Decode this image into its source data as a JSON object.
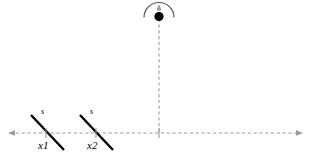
{
  "figure": {
    "title": "",
    "background_color": "#ffffff",
    "stroke_color": "#000000",
    "dashed_color": "#999999",
    "width": 310,
    "height": 158
  },
  "axis": {
    "name": "horizontal-axis",
    "style": "dashed",
    "y": 133,
    "x_start": 8,
    "x_end": 303,
    "arrow_left": true,
    "arrow_right": true
  },
  "vertical_line": {
    "name": "vertical-axis",
    "style": "dashed",
    "x": 159,
    "y_start": 5,
    "y_end": 133,
    "arrow_top": true
  },
  "arc": {
    "name": "semicircle-arc",
    "center_x": 159,
    "center_y": 16,
    "radius": 15,
    "opens": "down"
  },
  "point": {
    "name": "center-point",
    "x": 159,
    "y": 16,
    "radius": 4.5,
    "filled": true
  },
  "segments": [
    {
      "id": "x1",
      "label": "x1",
      "slope_label": "s",
      "x1": 31,
      "y1": 115,
      "x2": 64,
      "y2": 150,
      "label_x": 40,
      "label_y": 139,
      "slope_label_x": 41,
      "slope_label_y": 111,
      "tick_x": 46,
      "tick_y": 133
    },
    {
      "id": "x2",
      "label": "x2",
      "slope_label": "s",
      "x1": 80,
      "y1": 115,
      "x2": 113,
      "y2": 150,
      "label_x": 89,
      "label_y": 139,
      "slope_label_x": 90,
      "slope_label_y": 111,
      "tick_x": 96,
      "tick_y": 133
    }
  ],
  "labels": {
    "x1": "x1",
    "x2": "x2",
    "s1": "s",
    "s2": "s"
  }
}
